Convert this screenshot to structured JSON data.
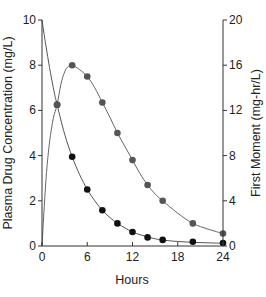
{
  "chart_data": {
    "type": "line",
    "title": "",
    "xlabel": "Hours",
    "ylabel": "Plasma Drug Concentration (mg/L)",
    "y2label": "First Moment (mg-hr/L)",
    "xlim": [
      0,
      24
    ],
    "ylim": [
      0,
      10
    ],
    "y2lim": [
      0,
      20
    ],
    "x_ticks": [
      0,
      6,
      12,
      18,
      24
    ],
    "y_ticks": [
      0,
      2,
      4,
      6,
      8,
      10
    ],
    "y2_ticks": [
      0,
      4,
      8,
      12,
      16,
      20
    ],
    "grid": false,
    "legend": null,
    "series": [
      {
        "name": "Plasma Drug Concentration",
        "axis": "left",
        "marker_color": "#111111",
        "line_color": "#555555",
        "x": [
          2,
          4,
          6,
          8,
          10,
          12,
          14,
          16,
          20,
          24
        ],
        "values": [
          6.25,
          3.95,
          2.5,
          1.58,
          1.0,
          0.62,
          0.38,
          0.27,
          0.19,
          0.13
        ],
        "curve_x": [
          0,
          0.5,
          1,
          1.5,
          2,
          3,
          4,
          5,
          6,
          7,
          8,
          9,
          10,
          11,
          12,
          13,
          14,
          15,
          16,
          18,
          20,
          22,
          24
        ],
        "curve_y": [
          10,
          8.9,
          7.9,
          7.0,
          6.25,
          4.95,
          3.95,
          3.15,
          2.5,
          2.0,
          1.58,
          1.26,
          1.0,
          0.8,
          0.62,
          0.5,
          0.4,
          0.32,
          0.26,
          0.2,
          0.16,
          0.14,
          0.12
        ]
      },
      {
        "name": "First Moment",
        "axis": "right",
        "marker_color": "#555555",
        "line_color": "#666666",
        "x": [
          2,
          4,
          6,
          8,
          10,
          12,
          14,
          16,
          20,
          24
        ],
        "values": [
          12.5,
          16.0,
          15.0,
          12.7,
          10.0,
          7.6,
          5.4,
          4.0,
          2.0,
          1.1
        ],
        "curve_x": [
          0,
          0.3,
          0.6,
          1,
          1.5,
          2,
          2.5,
          3,
          3.5,
          4,
          5,
          6,
          7,
          8,
          9,
          10,
          11,
          12,
          13,
          14,
          15,
          16,
          18,
          20,
          22,
          24
        ],
        "curve_y": [
          0,
          3.5,
          6.5,
          9.2,
          11.3,
          12.5,
          14.3,
          15.4,
          15.9,
          16.0,
          15.6,
          15.0,
          14.0,
          12.7,
          11.4,
          10.0,
          8.8,
          7.6,
          6.4,
          5.4,
          4.6,
          4.0,
          2.9,
          2.0,
          1.5,
          1.1
        ]
      }
    ]
  }
}
